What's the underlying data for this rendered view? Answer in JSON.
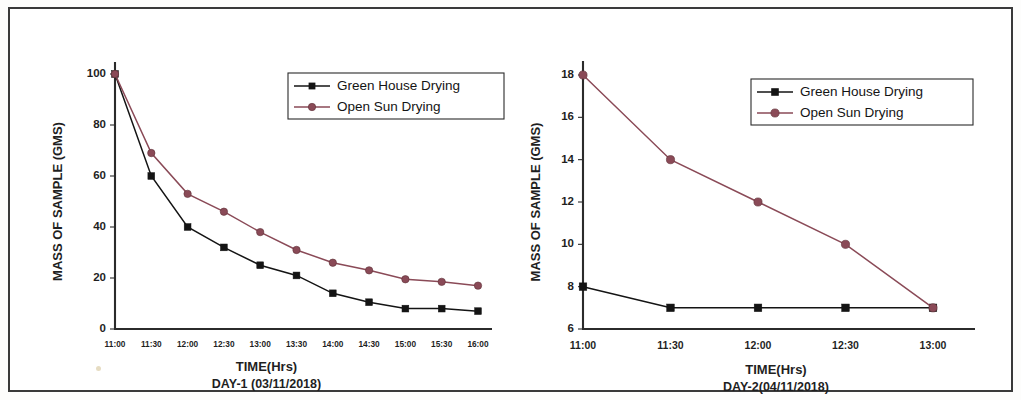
{
  "figure": {
    "background_color": "#ffffff",
    "frame_color": "#3a3a3a"
  },
  "colors": {
    "green_house": "#141414",
    "open_sun": "#8a4a57",
    "axis": "#2b2b2b",
    "text": "#1f1f1f"
  },
  "legend": {
    "green_house_label": "Green House Drying",
    "open_sun_label": "Open Sun Drying"
  },
  "chart_data": [
    {
      "type": "line",
      "panel": "left",
      "title": "",
      "xlabel": "TIME(Hrs)",
      "xlabel_sub": "DAY-1 (03/11/2018)",
      "ylabel": "MASS OF SAMPLE (GMS)",
      "categories": [
        "11:00",
        "11:30",
        "12:00",
        "12:30",
        "13:00",
        "13:30",
        "14:00",
        "14:30",
        "15:00",
        "15:30",
        "16:00"
      ],
      "ylim": [
        0,
        100
      ],
      "yticks": [
        0,
        20,
        40,
        60,
        80,
        100
      ],
      "grid": false,
      "legend_position": "top-right",
      "series": [
        {
          "name": "Green House Drying",
          "marker": "square",
          "color": "#141414",
          "values": [
            100,
            60,
            40,
            32,
            25,
            21,
            14,
            10.5,
            8,
            8,
            7
          ]
        },
        {
          "name": "Open Sun Drying",
          "marker": "circle",
          "color": "#8a4a57",
          "values": [
            100,
            69,
            53,
            46,
            38,
            31,
            26,
            23,
            19.5,
            18.5,
            17
          ]
        }
      ]
    },
    {
      "type": "line",
      "panel": "right",
      "title": "",
      "xlabel": "TIME(Hrs)",
      "xlabel_sub": "DAY-2(04/11/2018)",
      "ylabel": "MASS OF SAMPLE (GMS)",
      "categories": [
        "11:00",
        "11:30",
        "12:00",
        "12:30",
        "13:00"
      ],
      "ylim": [
        6,
        18
      ],
      "yticks": [
        6,
        8,
        10,
        12,
        14,
        16,
        18
      ],
      "grid": false,
      "legend_position": "top-right",
      "series": [
        {
          "name": "Green House Drying",
          "marker": "square",
          "color": "#141414",
          "values": [
            8,
            7,
            7,
            7,
            7
          ]
        },
        {
          "name": "Open Sun Drying",
          "marker": "circle",
          "color": "#8a4a57",
          "values": [
            18,
            14,
            12,
            10,
            7
          ]
        }
      ]
    }
  ]
}
